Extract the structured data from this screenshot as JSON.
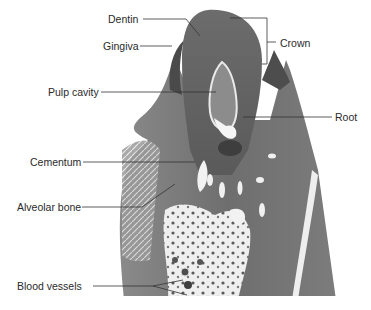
{
  "figure": {
    "type": "histology-micrograph",
    "colors": {
      "background": "#ffffff",
      "tissue_dark": "#5a5a5a",
      "tissue_mid": "#7a7a7a",
      "tissue_light": "#9a9a9a",
      "bone_white": "#f2f2f2",
      "leader_line": "#333333",
      "label_text": "#2a2a2a"
    }
  },
  "labels": {
    "dentin": "Dentin",
    "gingiva": "Gingiva",
    "pulp_cavity": "Pulp cavity",
    "cementum": "Cementum",
    "alveolar_bone": "Alveolar bone",
    "blood_vessels": "Blood vessels",
    "crown": "Crown",
    "root": "Root"
  }
}
